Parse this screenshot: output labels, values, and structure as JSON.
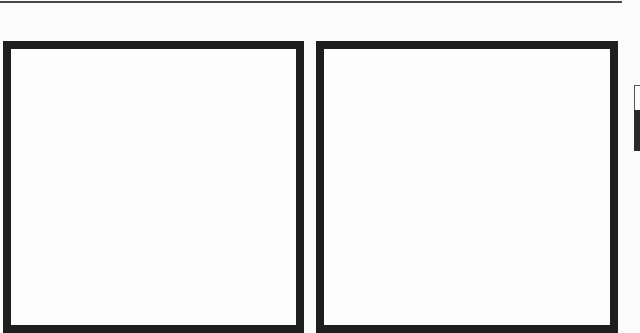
{
  "page": {
    "background_color": "#fbfbfb",
    "top_rule": {
      "color": "#4a4a4a"
    },
    "panels": [
      {
        "id": "left",
        "border_color": "#1e1e1e",
        "content": ""
      },
      {
        "id": "right",
        "border_color": "#1e1e1e",
        "content": ""
      }
    ],
    "side_tab": {
      "outline_color": "#555555",
      "fill_color": "#2a2a2a",
      "label": ""
    }
  }
}
